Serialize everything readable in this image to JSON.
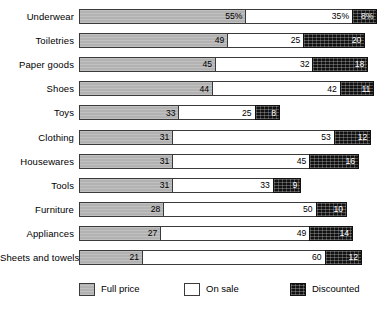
{
  "chart_data": {
    "type": "bar",
    "title": "",
    "subtitle": "",
    "xlabel": "",
    "ylabel": "",
    "orientation": "horizontal",
    "stacked": true,
    "grid": false,
    "axis_visible": false,
    "xlim": [
      0,
      98
    ],
    "legend_position": "bottom",
    "value_suffix_first_row": "%",
    "categories": [
      "Underwear",
      "Toiletries",
      "Paper goods",
      "Shoes",
      "Toys",
      "Clothing",
      "Housewares",
      "Tools",
      "Furniture",
      "Appliances",
      "Sheets and towels"
    ],
    "series": [
      {
        "name": "Full price",
        "color": "#b2b2b2",
        "values": [
          55,
          49,
          45,
          44,
          33,
          31,
          31,
          31,
          28,
          27,
          21
        ],
        "labels": [
          "55%",
          "49",
          "45",
          "44",
          "33",
          "31",
          "31",
          "31",
          "28",
          "27",
          "21"
        ]
      },
      {
        "name": "On sale",
        "color": "#ffffff",
        "values": [
          35,
          25,
          32,
          42,
          25,
          53,
          45,
          33,
          50,
          49,
          60
        ],
        "labels": [
          "35%",
          "25",
          "32",
          "42",
          "25",
          "53",
          "45",
          "33",
          "50",
          "49",
          "60"
        ]
      },
      {
        "name": "Discounted",
        "color": "#111111",
        "values": [
          8,
          20,
          18,
          11,
          8,
          12,
          16,
          9,
          10,
          14,
          12
        ],
        "labels": [
          "8%",
          "20",
          "18",
          "11",
          "8",
          "12",
          "16",
          "9",
          "10",
          "14",
          "12"
        ]
      }
    ],
    "totals": [
      98,
      94,
      95,
      97,
      66,
      96,
      92,
      73,
      88,
      90,
      93
    ]
  },
  "legend": {
    "items": [
      {
        "label": "Full price",
        "swatch": "full"
      },
      {
        "label": "On sale",
        "swatch": "sale"
      },
      {
        "label": "Discounted",
        "swatch": "disc"
      }
    ]
  }
}
